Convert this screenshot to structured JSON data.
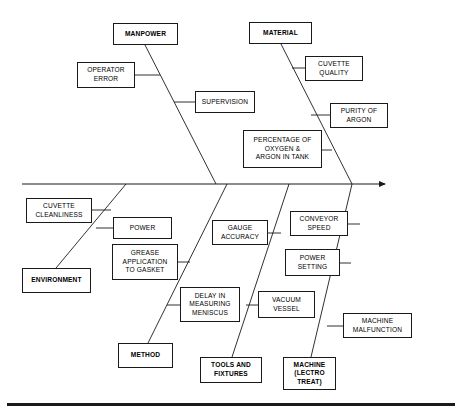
{
  "diagram": {
    "type": "fishbone-ishikawa",
    "title": "",
    "effect": {
      "id": "effect-head",
      "label": "MENISCUS\nNOT WITHIN\nSPEC",
      "x": 386,
      "y": 167,
      "w": 57,
      "h": 32
    },
    "spine": {
      "x1": 22,
      "y1": 184,
      "x2": 385,
      "y2": 184
    },
    "categories": [
      {
        "id": "manpower",
        "label": "MANPOWER",
        "side": "top",
        "box": {
          "x": 113,
          "y": 23,
          "w": 65,
          "h": 22
        },
        "bone": {
          "x1": 145,
          "y1": 45,
          "x2": 216,
          "y2": 184
        },
        "causes": [
          {
            "id": "operator-error",
            "label": "OPERATOR\nERROR",
            "box": {
              "x": 77,
              "y": 62,
              "w": 58,
              "h": 26
            },
            "stub": {
              "x1": 135,
              "y1": 75,
              "x2": 160,
              "y2": 75
            }
          },
          {
            "id": "supervision",
            "label": "SUPERVISION",
            "box": {
              "x": 195,
              "y": 91,
              "w": 60,
              "h": 22
            },
            "stub": {
              "x1": 195,
              "y1": 102,
              "x2": 174,
              "y2": 102
            }
          }
        ]
      },
      {
        "id": "material",
        "label": "MATERIAL",
        "side": "top",
        "box": {
          "x": 249,
          "y": 22,
          "w": 63,
          "h": 22
        },
        "bone": {
          "x1": 281,
          "y1": 44,
          "x2": 352,
          "y2": 184
        },
        "causes": [
          {
            "id": "cuvette-quality",
            "label": "CUVETTE\nQUALITY",
            "box": {
              "x": 305,
              "y": 56,
              "w": 58,
              "h": 25
            },
            "stub": {
              "x1": 305,
              "y1": 68,
              "x2": 292,
              "y2": 68
            }
          },
          {
            "id": "purity-of-argon",
            "label": "PURITY OF\nARGON",
            "box": {
              "x": 330,
              "y": 103,
              "w": 58,
              "h": 25
            },
            "stub": {
              "x1": 330,
              "y1": 115,
              "x2": 311,
              "y2": 115
            }
          },
          {
            "id": "percentage-oxygen-argon",
            "label": "PERCENTAGE OF\nOXYGEN &\nARGON IN TANK",
            "box": {
              "x": 243,
              "y": 130,
              "w": 79,
              "h": 38
            },
            "stub": {
              "x1": 322,
              "y1": 150,
              "x2": 332,
              "y2": 150
            }
          }
        ]
      },
      {
        "id": "environment",
        "label": "ENVIRONMENT",
        "side": "bottom",
        "box": {
          "x": 22,
          "y": 268,
          "w": 69,
          "h": 25
        },
        "bone": {
          "x1": 56,
          "y1": 268,
          "x2": 126,
          "y2": 184
        },
        "causes": [
          {
            "id": "cuvette-cleanliness",
            "label": "CUVETTE\nCLEANLINESS",
            "box": {
              "x": 26,
              "y": 198,
              "w": 66,
              "h": 25
            },
            "stub": {
              "x1": 92,
              "y1": 210,
              "x2": 111,
              "y2": 210
            }
          },
          {
            "id": "power",
            "label": "POWER",
            "box": {
              "x": 113,
              "y": 217,
              "w": 59,
              "h": 22
            },
            "stub": {
              "x1": 113,
              "y1": 228,
              "x2": 96,
              "y2": 228
            }
          }
        ]
      },
      {
        "id": "method",
        "label": "METHOD",
        "side": "bottom",
        "box": {
          "x": 118,
          "y": 343,
          "w": 55,
          "h": 25
        },
        "bone": {
          "x1": 148,
          "y1": 343,
          "x2": 227,
          "y2": 184
        },
        "causes": [
          {
            "id": "grease-application",
            "label": "GREASE\nAPPLICATION\nTO GASKET",
            "box": {
              "x": 112,
              "y": 244,
              "w": 66,
              "h": 36
            },
            "stub": {
              "x1": 178,
              "y1": 262,
              "x2": 190,
              "y2": 262
            }
          },
          {
            "id": "delay-measuring-meniscus",
            "label": "DELAY IN\nMEASURING\nMENISCUS",
            "box": {
              "x": 180,
              "y": 287,
              "w": 60,
              "h": 35
            },
            "stub": {
              "x1": 180,
              "y1": 305,
              "x2": 167,
              "y2": 305
            }
          }
        ]
      },
      {
        "id": "tools-and-fixtures",
        "label": "TOOLS AND\nFIXTURES",
        "side": "bottom",
        "box": {
          "x": 200,
          "y": 357,
          "w": 62,
          "h": 26
        },
        "bone": {
          "x1": 232,
          "y1": 357,
          "x2": 289,
          "y2": 184
        },
        "causes": [
          {
            "id": "gauge-accuracy",
            "label": "GAUGE\nACCURACY",
            "box": {
              "x": 212,
              "y": 220,
              "w": 56,
              "h": 25
            },
            "stub": {
              "x1": 268,
              "y1": 233,
              "x2": 281,
              "y2": 233
            }
          },
          {
            "id": "vacuum-vessel",
            "label": "VACUUM\nVESSEL",
            "box": {
              "x": 258,
              "y": 291,
              "w": 57,
              "h": 27
            },
            "stub": {
              "x1": 258,
              "y1": 305,
              "x2": 246,
              "y2": 305
            }
          }
        ]
      },
      {
        "id": "machine-lectro-treat",
        "label": "MACHINE\n(LECTRO\nTREAT)",
        "side": "bottom",
        "box": {
          "x": 283,
          "y": 357,
          "w": 53,
          "h": 33
        },
        "bone": {
          "x1": 311,
          "y1": 357,
          "x2": 352,
          "y2": 184
        },
        "causes": [
          {
            "id": "conveyor-speed",
            "label": "CONVEYOR\nSPEED",
            "box": {
              "x": 290,
              "y": 211,
              "w": 58,
              "h": 25
            },
            "stub": {
              "x1": 348,
              "y1": 224,
              "x2": 360,
              "y2": 224
            }
          },
          {
            "id": "power-setting",
            "label": "POWER\nSETTING",
            "box": {
              "x": 285,
              "y": 249,
              "w": 55,
              "h": 27
            },
            "stub": {
              "x1": 340,
              "y1": 263,
              "x2": 351,
              "y2": 263
            }
          },
          {
            "id": "machine-malfunction",
            "label": "MACHINE\nMALFUNCTION",
            "box": {
              "x": 343,
              "y": 313,
              "w": 69,
              "h": 25
            },
            "stub": {
              "x1": 343,
              "y1": 326,
              "x2": 327,
              "y2": 326
            }
          }
        ]
      }
    ],
    "colors": {
      "line": "#1a1a1a",
      "box_fill": "#ffffff",
      "text": "#000000",
      "background": "#ffffff"
    }
  }
}
